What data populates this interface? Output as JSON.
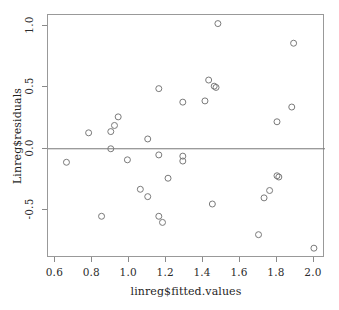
{
  "chart_data": {
    "type": "scatter",
    "title": "",
    "xlabel": "linreg$fitted.values",
    "ylabel": "Linreg$residuals",
    "xlim": [
      0.56,
      2.06
    ],
    "ylim": [
      -0.89,
      1.09
    ],
    "xticks": [
      "0.6",
      "0.8",
      "1.0",
      "1.2",
      "1.4",
      "1.6",
      "1.8",
      "2.0"
    ],
    "xtick_values": [
      0.6,
      0.8,
      1.0,
      1.2,
      1.4,
      1.6,
      1.8,
      2.0
    ],
    "yticks": [
      "1.0",
      "0.5",
      "0.0",
      "-0.5"
    ],
    "ytick_values": [
      1.0,
      0.5,
      0.0,
      -0.5
    ],
    "grid": false,
    "legend": null,
    "reference_lines": [
      {
        "orientation": "horizontal",
        "value": 0.0,
        "color": "#777777"
      }
    ],
    "marker": {
      "shape": "open-circle",
      "color": "#7a7a7a",
      "radius": 3.0,
      "stroke_width": 1.0
    },
    "points": [
      {
        "x": 0.66,
        "y": -0.11
      },
      {
        "x": 0.78,
        "y": 0.13
      },
      {
        "x": 0.85,
        "y": -0.55
      },
      {
        "x": 0.9,
        "y": 0.14
      },
      {
        "x": 0.9,
        "y": 0.0
      },
      {
        "x": 0.92,
        "y": 0.19
      },
      {
        "x": 0.94,
        "y": 0.26
      },
      {
        "x": 0.99,
        "y": -0.09
      },
      {
        "x": 1.06,
        "y": -0.33
      },
      {
        "x": 1.1,
        "y": 0.08
      },
      {
        "x": 1.1,
        "y": -0.39
      },
      {
        "x": 1.16,
        "y": 0.49
      },
      {
        "x": 1.16,
        "y": -0.05
      },
      {
        "x": 1.16,
        "y": -0.55
      },
      {
        "x": 1.18,
        "y": -0.6
      },
      {
        "x": 1.21,
        "y": -0.24
      },
      {
        "x": 1.29,
        "y": 0.38
      },
      {
        "x": 1.29,
        "y": -0.06
      },
      {
        "x": 1.29,
        "y": -0.1
      },
      {
        "x": 1.41,
        "y": 0.39
      },
      {
        "x": 1.43,
        "y": 0.56
      },
      {
        "x": 1.45,
        "y": -0.45
      },
      {
        "x": 1.46,
        "y": 0.51
      },
      {
        "x": 1.47,
        "y": 0.5
      },
      {
        "x": 1.48,
        "y": 1.02
      },
      {
        "x": 1.7,
        "y": -0.7
      },
      {
        "x": 1.73,
        "y": -0.4
      },
      {
        "x": 1.76,
        "y": -0.34
      },
      {
        "x": 1.8,
        "y": 0.22
      },
      {
        "x": 1.8,
        "y": -0.22
      },
      {
        "x": 1.81,
        "y": -0.23
      },
      {
        "x": 1.88,
        "y": 0.34
      },
      {
        "x": 1.89,
        "y": 0.86
      },
      {
        "x": 2.0,
        "y": -0.81
      }
    ]
  }
}
